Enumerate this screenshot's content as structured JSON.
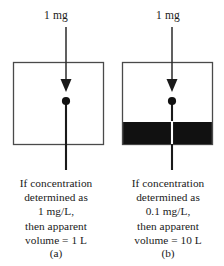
{
  "figure": {
    "type": "diagram",
    "background_color": "#ffffff",
    "line_color": "#3a3a3a",
    "fill_color": "#111111"
  },
  "panels": [
    {
      "id": "a",
      "letter": "(a)",
      "dose_label": "1 mg",
      "box": {
        "filled": false,
        "fill_fraction": 0.0
      },
      "caption_lines": [
        "If concentration",
        "determined as",
        "1 mg/L,",
        "then apparent",
        "volume = 1 L"
      ],
      "concentration": "1 mg/L",
      "apparent_volume": "1 L"
    },
    {
      "id": "b",
      "letter": "(b)",
      "dose_label": "1 mg",
      "box": {
        "filled": true,
        "fill_fraction": 0.26
      },
      "caption_lines": [
        "If concentration",
        "determined as",
        "0.1 mg/L,",
        "then apparent",
        "volume = 10 L"
      ],
      "concentration": "0.1 mg/L",
      "apparent_volume": "10 L"
    }
  ]
}
